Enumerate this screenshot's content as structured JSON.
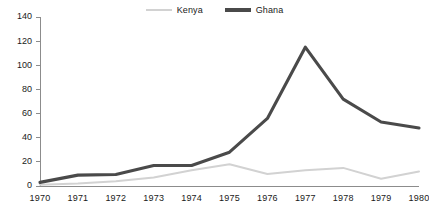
{
  "chart_data": {
    "type": "line",
    "title": "",
    "xlabel": "",
    "ylabel": "",
    "categories": [
      "1970",
      "1971",
      "1972",
      "1973",
      "1974",
      "1975",
      "1976",
      "1977",
      "1978",
      "1979",
      "1980"
    ],
    "x": [
      1970,
      1971,
      1972,
      1973,
      1974,
      1975,
      1976,
      1977,
      1978,
      1979,
      1980
    ],
    "series": [
      {
        "name": "Kenya",
        "color": "#d2d2d2",
        "values": [
          1,
          2,
          4,
          7,
          13,
          18,
          10,
          13,
          15,
          6,
          12
        ]
      },
      {
        "name": "Ghana",
        "color": "#4a4a4a",
        "values": [
          3,
          9,
          9.5,
          17,
          17,
          28,
          56,
          115,
          72,
          53,
          48
        ]
      }
    ],
    "ylim": [
      0,
      140
    ],
    "yticks": [
      0,
      20,
      40,
      60,
      80,
      100,
      120,
      140
    ],
    "ytick_labels": [
      "0",
      "20",
      "40",
      "60",
      "80",
      "100",
      "120",
      "140"
    ],
    "xlim": [
      1970,
      1980
    ],
    "grid": false,
    "legend_position": "top-center",
    "axis_color": "#8c8c8c"
  },
  "legend": {
    "entries": [
      {
        "label": "Kenya",
        "swatch": "line-swatch-light"
      },
      {
        "label": "Ghana",
        "swatch": "line-swatch-dark"
      }
    ]
  }
}
